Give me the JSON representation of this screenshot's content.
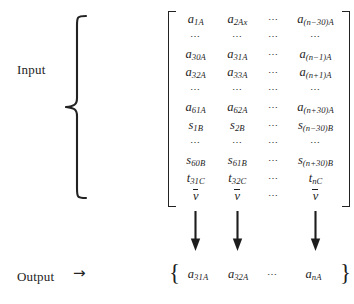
{
  "labels": {
    "input": "Input",
    "output": "Output",
    "output_arrow": "→"
  },
  "icons": {
    "left_curly_brace": "left-curly-brace",
    "down_arrow": "down-arrow",
    "matrix_bracket": "square-bracket"
  },
  "matrix": {
    "columns": 4,
    "rows": [
      [
        {
          "base": "a",
          "sub": "1A"
        },
        {
          "base": "a",
          "sub": "2Ax"
        },
        {
          "ellipsis": "⋯"
        },
        {
          "base": "a",
          "sub": "(n−30)A"
        }
      ],
      [
        {
          "ellipsis": "⋯"
        },
        {
          "ellipsis": "⋯"
        },
        {
          "ellipsis": "⋯"
        },
        {
          "ellipsis": "⋯"
        }
      ],
      [
        {
          "base": "a",
          "sub": "30A"
        },
        {
          "base": "a",
          "sub": "31A"
        },
        {
          "ellipsis": "⋯"
        },
        {
          "base": "a",
          "sub": "(n−1)A"
        }
      ],
      [
        {
          "base": "a",
          "sub": "32A"
        },
        {
          "base": "a",
          "sub": "33A"
        },
        {
          "ellipsis": "⋯"
        },
        {
          "base": "a",
          "sub": "(n+1)A"
        }
      ],
      [
        {
          "ellipsis": "⋯"
        },
        {
          "ellipsis": "⋯"
        },
        {
          "ellipsis": "⋯"
        },
        {
          "ellipsis": "⋯"
        }
      ],
      [
        {
          "base": "a",
          "sub": "61A"
        },
        {
          "base": "a",
          "sub": "62A"
        },
        {
          "ellipsis": "⋯"
        },
        {
          "base": "a",
          "sub": "(n+30)A"
        }
      ],
      [
        {
          "base": "s",
          "sub": "1B"
        },
        {
          "base": "s",
          "sub": "2B"
        },
        {
          "ellipsis": "⋯"
        },
        {
          "base": "s",
          "sub": "(n−30)B"
        }
      ],
      [
        {
          "ellipsis": "⋯"
        },
        {
          "ellipsis": "⋯"
        },
        {
          "ellipsis": "⋯"
        },
        {
          "ellipsis": "⋯"
        }
      ],
      [
        {
          "base": "s",
          "sub": "60B"
        },
        {
          "base": "s",
          "sub": "61B"
        },
        {
          "ellipsis": "⋯"
        },
        {
          "base": "s",
          "sub": "(n+30)B"
        }
      ],
      [
        {
          "base": "t",
          "sub": "31C"
        },
        {
          "base": "t",
          "sub": "32C"
        },
        {
          "ellipsis": "⋯"
        },
        {
          "base": "t",
          "sub": "nC"
        }
      ],
      [
        {
          "base": "v",
          "sub": "",
          "overline": true
        },
        {
          "base": "v",
          "sub": "",
          "overline": true
        },
        {
          "ellipsis": "⋯"
        },
        {
          "base": "v",
          "sub": "",
          "overline": true
        }
      ]
    ]
  },
  "arrows": {
    "columns_with_arrow": [
      true,
      true,
      false,
      true
    ]
  },
  "output_set": {
    "open_brace": "{",
    "close_brace": "}",
    "items": [
      {
        "base": "a",
        "sub": "31A"
      },
      {
        "base": "a",
        "sub": "32A"
      },
      {
        "ellipsis": "⋯"
      },
      {
        "base": "a",
        "sub": "nA"
      }
    ]
  },
  "colors": {
    "background": "#ffffff",
    "ink": "#1d1d1d"
  }
}
